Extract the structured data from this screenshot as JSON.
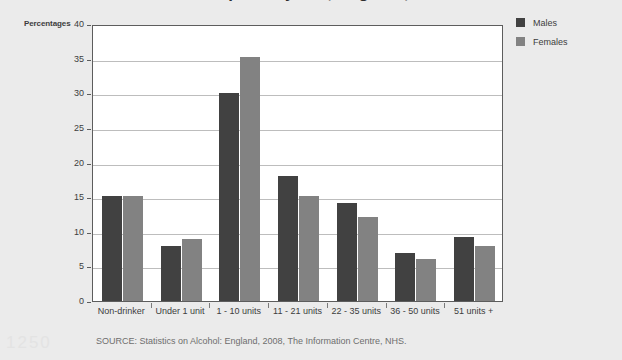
{
  "page": {
    "background_color": "#ebebeb",
    "title_partial": "Alcohol consumption by sex, England, 2007",
    "artifact_text": "1250"
  },
  "axis": {
    "y_title": "Percentages",
    "y_ticks": [
      "0",
      "5",
      "10",
      "15",
      "20",
      "25",
      "30",
      "35",
      "40"
    ]
  },
  "legend": {
    "items": [
      {
        "label": "Males",
        "color": "#414141"
      },
      {
        "label": "Females",
        "color": "#828282"
      }
    ]
  },
  "source": {
    "text": "SOURCE: Statistics on Alcohol: England, 2008, The Information Centre, NHS."
  },
  "chart_data": {
    "type": "bar",
    "title": "Alcohol consumption by sex, England, 2007",
    "xlabel": "",
    "ylabel": "Percentages",
    "ylim": [
      0,
      40
    ],
    "ytick_step": 5,
    "grid": true,
    "legend_position": "top-right",
    "categories": [
      "Non-drinker",
      "Under 1 unit",
      "1 - 10 units",
      "11 - 21 units",
      "22 - 35 units",
      "36 - 50 units",
      "51 units +"
    ],
    "series": [
      {
        "name": "Males",
        "color": "#414141",
        "values": [
          15.2,
          8.0,
          30.0,
          18.0,
          14.2,
          7.0,
          9.3
        ]
      },
      {
        "name": "Females",
        "color": "#828282",
        "values": [
          15.2,
          9.0,
          35.3,
          15.2,
          12.1,
          6.0,
          8.0
        ]
      }
    ]
  }
}
